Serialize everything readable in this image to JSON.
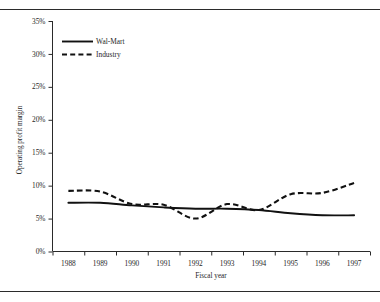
{
  "figure": {
    "background": "#ffffff",
    "ink_color": "#111111"
  },
  "chart_data": {
    "type": "line",
    "title": "",
    "subtitle": "",
    "xlabel": "Fiscal year",
    "ylabel": "Operating profit margin",
    "x": [
      1988,
      1989,
      1990,
      1991,
      1992,
      1993,
      1994,
      1995,
      1996,
      1997
    ],
    "categories": [
      "1988",
      "1989",
      "1990",
      "1991",
      "1992",
      "1993",
      "1994",
      "1995",
      "1996",
      "1997"
    ],
    "xtick_labels": [
      "1988",
      "1989",
      "1990",
      "1991",
      "1992",
      "1993",
      "1994",
      "1995",
      "1996",
      "1997"
    ],
    "ytick_labels": [
      "0%",
      "5%",
      "10%",
      "15%",
      "20%",
      "25%",
      "30%",
      "35%"
    ],
    "ytick_values": [
      0,
      5,
      10,
      15,
      20,
      25,
      30,
      35
    ],
    "ylim": [
      0,
      35
    ],
    "xlim": [
      1988,
      1997
    ],
    "grid": false,
    "legend_position": "top-left",
    "series": [
      {
        "name": "Wal-Mart",
        "style": "solid",
        "color": "#111111",
        "values": [
          7.4,
          7.4,
          7.0,
          6.7,
          6.5,
          6.5,
          6.3,
          5.8,
          5.5,
          5.5
        ]
      },
      {
        "name": "Industry",
        "style": "dashed",
        "color": "#111111",
        "values": [
          9.2,
          9.1,
          7.2,
          7.1,
          5.0,
          7.2,
          6.3,
          8.7,
          8.9,
          10.4
        ]
      }
    ],
    "annotations": []
  },
  "legend": {
    "items": [
      {
        "label": "Wal-Mart",
        "style": "solid"
      },
      {
        "label": "Industry",
        "style": "dashed"
      }
    ]
  },
  "axes": {
    "y_title": "Operating profit margin",
    "x_title": "Fiscal year"
  }
}
